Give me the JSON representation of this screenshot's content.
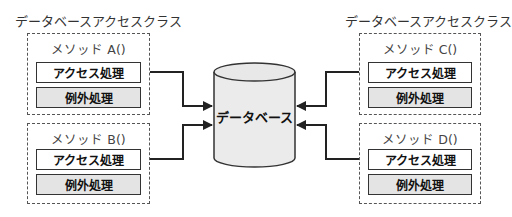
{
  "left_class": {
    "title": "データベースアクセスクラス",
    "methods": [
      {
        "name": "メソッド A()",
        "access_label": "アクセス処理",
        "exception_label": "例外処理"
      },
      {
        "name": "メソッド B()",
        "access_label": "アクセス処理",
        "exception_label": "例外処理"
      }
    ]
  },
  "right_class": {
    "title": "データベースアクセスクラス",
    "methods": [
      {
        "name": "メソッド C()",
        "access_label": "アクセス処理",
        "exception_label": "例外処理"
      },
      {
        "name": "メソッド D()",
        "access_label": "アクセス処理",
        "exception_label": "例外処理"
      }
    ]
  },
  "database": {
    "label": "データベース"
  },
  "colors": {
    "line": "#222222",
    "dashed_border": "#555555",
    "exception_fill": "#e4e4e4",
    "database_fill": "#ebebeb"
  }
}
